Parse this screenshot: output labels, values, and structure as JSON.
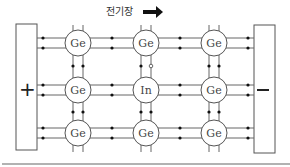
{
  "diagram": {
    "field_label": "전기장",
    "field_direction": "right",
    "left_plate": {
      "sign": "+"
    },
    "right_plate": {
      "sign": "−"
    },
    "lattice": {
      "rows": [
        [
          "Ge",
          "Ge",
          "Ge"
        ],
        [
          "Ge",
          "In",
          "Ge"
        ],
        [
          "Ge",
          "Ge",
          "Ge"
        ]
      ]
    },
    "hole": {
      "description": "hole (open circle) on bond between top-center Ge and In",
      "between": [
        "0,1",
        "1,1"
      ]
    },
    "colors": {
      "line": "#555555",
      "electron": "#111111",
      "hole_fill": "#ffffff",
      "arrow": "#111111",
      "bottom_rule": "#999999"
    }
  }
}
